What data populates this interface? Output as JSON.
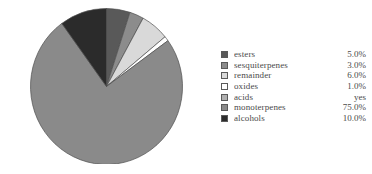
{
  "chart_data": {
    "type": "pie",
    "title": "",
    "xlabel": "",
    "ylabel": "",
    "start_angle_deg": 0,
    "direction": "clockwise",
    "legend_position": "right",
    "grid": false,
    "categories": [
      "esters",
      "sesquiterpenes",
      "remainder",
      "oxides",
      "acids",
      "monoterpenes",
      "alcohols"
    ],
    "values": [
      5.0,
      3.0,
      6.0,
      1.0,
      0.0,
      75.0,
      10.0
    ],
    "value_labels": [
      "5.0%",
      "3.0%",
      "6.0%",
      "1.0%",
      "yes",
      "75.0%",
      "10.0%"
    ],
    "colors": [
      "#595959",
      "#8c8c8c",
      "#d9d9d9",
      "#ffffff",
      "#b0b0b0",
      "#8a8a8a",
      "#2b2b2b"
    ],
    "slice_edge_color": "#4f4f4f"
  },
  "legend": {
    "rows": [
      {
        "label": "esters",
        "value": "5.0%",
        "color": "#595959"
      },
      {
        "label": "sesquiterpenes",
        "value": "3.0%",
        "color": "#8c8c8c"
      },
      {
        "label": "remainder",
        "value": "6.0%",
        "color": "#d9d9d9"
      },
      {
        "label": "oxides",
        "value": "1.0%",
        "color": "#ffffff"
      },
      {
        "label": "acids",
        "value": "yes",
        "color": "#b0b0b0"
      },
      {
        "label": "monoterpenes",
        "value": "75.0%",
        "color": "#8a8a8a"
      },
      {
        "label": "alcohols",
        "value": "10.0%",
        "color": "#2b2b2b"
      }
    ]
  }
}
